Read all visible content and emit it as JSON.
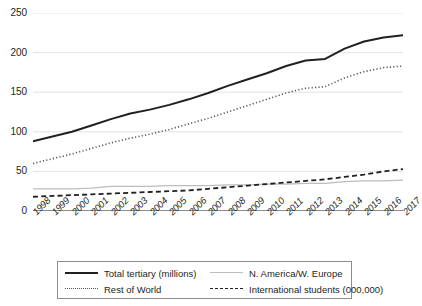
{
  "chart_data": {
    "type": "line",
    "title": "",
    "xlabel": "",
    "ylabel": "",
    "ylim": [
      0,
      250
    ],
    "yticks": [
      0,
      50,
      100,
      150,
      200,
      250
    ],
    "grid": true,
    "legend_position": "bottom",
    "categories": [
      "1998",
      "1999",
      "2000",
      "2001",
      "2002",
      "2003",
      "2004",
      "2005",
      "2006",
      "2007",
      "2008",
      "2009",
      "2010",
      "2011",
      "2012",
      "2013",
      "2014",
      "2015",
      "2016",
      "2017"
    ],
    "series": [
      {
        "name": "Total tertiary (millions)",
        "style": "solid",
        "color": "#231f20",
        "values": [
          88,
          94,
          100,
          108,
          116,
          123,
          128,
          134,
          141,
          149,
          158,
          166,
          174,
          183,
          190,
          192,
          205,
          214,
          219,
          222
        ]
      },
      {
        "name": "Rest of World",
        "style": "dotted",
        "color": "#58595b",
        "values": [
          60,
          66,
          72,
          79,
          86,
          92,
          97,
          103,
          110,
          117,
          125,
          133,
          141,
          149,
          155,
          157,
          168,
          176,
          181,
          183
        ]
      },
      {
        "name": "N. America/W. Europe",
        "style": "thin-solid",
        "color": "#bdbdbd",
        "values": [
          28,
          28,
          28,
          29,
          31,
          31,
          31,
          32,
          32,
          32,
          33,
          33,
          34,
          34,
          35,
          35,
          37,
          38,
          38,
          39
        ]
      },
      {
        "name": "International students (000,000)",
        "style": "dashed",
        "color": "#231f20",
        "values": [
          18,
          19,
          20,
          21,
          22,
          23,
          24,
          25,
          26,
          28,
          30,
          32,
          34,
          36,
          38,
          40,
          43,
          46,
          50,
          53
        ]
      }
    ]
  },
  "yaxis": {
    "ticks": [
      "0",
      "50",
      "100",
      "150",
      "200",
      "250"
    ]
  },
  "xaxis": {
    "ticks": [
      "1998",
      "1999",
      "2000",
      "2001",
      "2002",
      "2003",
      "2004",
      "2005",
      "2006",
      "2007",
      "2008",
      "2009",
      "2010",
      "2011",
      "2012",
      "2013",
      "2014",
      "2015",
      "2016",
      "2017"
    ]
  },
  "legend": {
    "entries": [
      {
        "label": "Total tertiary (millions)",
        "style": "solid"
      },
      {
        "label": "N. America/W. Europe",
        "style": "thin-solid"
      },
      {
        "label": "Rest of World",
        "style": "dotted"
      },
      {
        "label": "International students (000,000)",
        "style": "dashed"
      }
    ]
  },
  "colors": {
    "ink": "#231f20",
    "grid": "#e3e3e3",
    "axis": "#8c8c8c",
    "gray_series": "#bdbdbd",
    "dotted_series": "#58595b",
    "background": "#ffffff"
  }
}
